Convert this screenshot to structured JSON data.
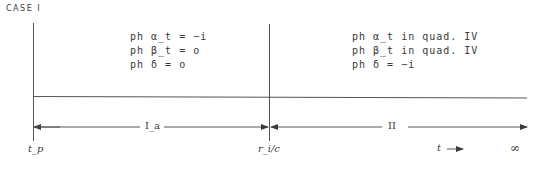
{
  "title": "CASE I",
  "region_left": {
    "conditions": [
      "ph α_t = −i",
      "ph β_t =  o",
      "ph δ  =  o"
    ]
  },
  "region_right": {
    "conditions": [
      "ph α_t  in  quad. IV",
      "ph β_t  in  quad. IV",
      "ph δ = −i"
    ]
  },
  "intervals": [
    {
      "label": "I_a",
      "from": "t_p",
      "to": "r_i/c"
    },
    {
      "label": "II",
      "from": "r_i/c",
      "to": "∞"
    }
  ],
  "axis_labels": {
    "start": "t_p",
    "middle": "r_i/c",
    "time": "t",
    "end": "∞"
  },
  "colors": {
    "ink": "#3a3a3a",
    "background": "#ffffff"
  }
}
